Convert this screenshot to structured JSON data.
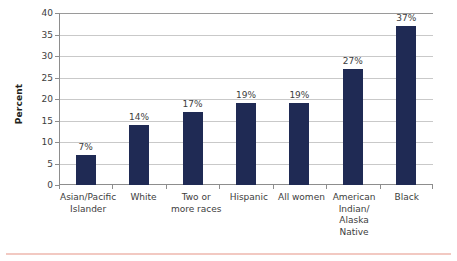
{
  "chart_data": {
    "type": "bar",
    "title": "",
    "xlabel": "",
    "ylabel": "Percent",
    "ylim": [
      0,
      40
    ],
    "ystep": 5,
    "grid": true,
    "legend": false,
    "orientation": "vertical",
    "bar_color": "#1f2a54",
    "gridline_color": "#c9c9c9",
    "axis_color": "#8d8d8d",
    "accent_rule_color": "#f2c9c2",
    "categories": [
      "Asian/Pacific\nIslander",
      "White",
      "Two or\nmore races",
      "Hispanic",
      "All women",
      "American\nIndian/\nAlaska\nNative",
      "Black"
    ],
    "category_lines": [
      [
        "Asian/Pacific",
        "Islander"
      ],
      [
        "White"
      ],
      [
        "Two or",
        "more races"
      ],
      [
        "Hispanic"
      ],
      [
        "All women"
      ],
      [
        "American",
        "Indian/",
        "Alaska",
        "Native"
      ],
      [
        "Black"
      ]
    ],
    "values": [
      7,
      14,
      17,
      19,
      19,
      27,
      37
    ],
    "data_labels": [
      "7%",
      "14%",
      "17%",
      "19%",
      "19%",
      "27%",
      "37%"
    ],
    "ytick_labels": [
      "40",
      "35",
      "30",
      "25",
      "20",
      "15",
      "10",
      "5",
      "0"
    ],
    "ytick_values": [
      40,
      35,
      30,
      25,
      20,
      15,
      10,
      5,
      0
    ]
  }
}
